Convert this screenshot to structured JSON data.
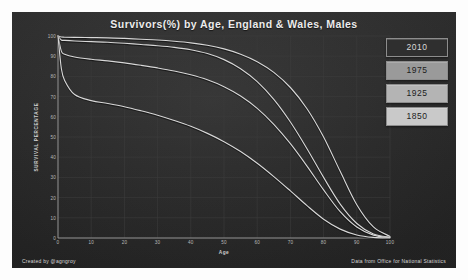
{
  "title": "Survivors(%) by Age, England & Wales, Males",
  "footer": {
    "left": "Created by @agngroy",
    "right": "Data from Office for National Statistics"
  },
  "legend": {
    "items": [
      {
        "label": "2010",
        "bg": "#2f2f2f",
        "fg": "#d9d9d9"
      },
      {
        "label": "1975",
        "bg": "#9a9a9a",
        "fg": "#1c1c1c"
      },
      {
        "label": "1925",
        "bg": "#b4b4b4",
        "fg": "#1c1c1c"
      },
      {
        "label": "1850",
        "bg": "#c9c9c9",
        "fg": "#1c1c1c"
      }
    ]
  },
  "colors": {
    "panel_bg": "#2e2e2e",
    "line": "#d8d8d8",
    "grid": "#3c3c3c",
    "axis": "#9a9a9a",
    "tick_text": "#b9b9b9"
  },
  "chart_data": {
    "type": "line",
    "title": "Survivors(%) by Age, England & Wales, Males",
    "xlabel": "Age",
    "ylabel": "SURVIVAL PERCENTAGE",
    "xlim": [
      0,
      100
    ],
    "ylim": [
      0,
      100
    ],
    "xticks": [
      0,
      10,
      20,
      30,
      40,
      50,
      60,
      70,
      80,
      90,
      100
    ],
    "yticks": [
      0,
      10,
      20,
      30,
      40,
      50,
      60,
      70,
      80,
      90,
      100
    ],
    "grid": true,
    "legend_position": "right",
    "x": [
      0,
      1,
      2,
      5,
      10,
      15,
      20,
      25,
      30,
      35,
      40,
      45,
      50,
      55,
      60,
      65,
      70,
      75,
      80,
      85,
      90,
      95,
      100
    ],
    "series": [
      {
        "name": "2010",
        "values": [
          100,
          99.5,
          99.4,
          99.3,
          99.2,
          99.1,
          98.8,
          98.4,
          98.0,
          97.4,
          96.6,
          95.4,
          93.6,
          91.0,
          87.3,
          82.0,
          74.5,
          64.0,
          50.0,
          33.0,
          16.5,
          5.5,
          0.8
        ]
      },
      {
        "name": "1975",
        "values": [
          100,
          98.0,
          97.8,
          97.5,
          97.2,
          96.9,
          96.4,
          95.8,
          95.2,
          94.4,
          93.2,
          91.3,
          88.3,
          83.8,
          77.4,
          68.6,
          57.4,
          44.2,
          30.0,
          16.8,
          7.2,
          2.0,
          0.3
        ]
      },
      {
        "name": "1925",
        "values": [
          100,
          92.5,
          91.0,
          89.6,
          88.5,
          87.7,
          86.7,
          85.5,
          84.2,
          82.7,
          80.8,
          78.3,
          74.9,
          70.3,
          64.2,
          56.3,
          46.7,
          35.6,
          23.8,
          13.0,
          5.4,
          1.4,
          0.2
        ]
      },
      {
        "name": "1850",
        "values": [
          100,
          84.0,
          78.0,
          71.0,
          68.0,
          66.6,
          65.0,
          63.0,
          60.8,
          58.2,
          55.3,
          51.8,
          47.7,
          42.8,
          37.0,
          30.4,
          23.3,
          16.0,
          9.3,
          4.4,
          1.5,
          0.3,
          0.0
        ]
      }
    ]
  }
}
